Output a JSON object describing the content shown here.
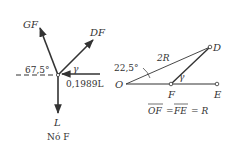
{
  "left_diagram": {
    "labels": {
      "gf": "GF",
      "df": "DF",
      "angle": "67,5°",
      "gamma": "γ",
      "force": "0,1989L",
      "load": "L",
      "node": "Nó F"
    }
  },
  "right_diagram": {
    "labels": {
      "angle": "22,5°",
      "two_r": "2R",
      "gamma": "γ",
      "o": "O",
      "f": "F",
      "d": "D",
      "e": "E",
      "equation_of": "OF",
      "equation_fe": "FE",
      "equation_rest": "= R",
      "equals": "="
    }
  },
  "colors": {
    "ink": "#333333"
  }
}
